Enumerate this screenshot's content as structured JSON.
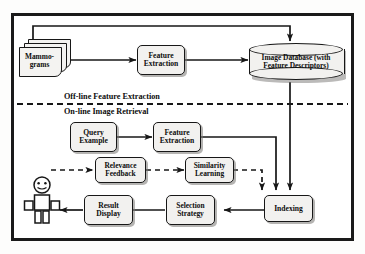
{
  "figure": {
    "border_color": "#1a1a1a",
    "node_fill": "#f2f1ef",
    "line_color": "#171717"
  },
  "phases": {
    "offline_label": "Off-line Feature Extraction",
    "online_label": "On-line Image Retrieval"
  },
  "nodes": {
    "mammograms": {
      "label": "Mammo-\ngrams",
      "shape": "stacked-documents"
    },
    "feature_extraction_offline": {
      "label": "Feature\nExtraction",
      "shape": "rounded-box"
    },
    "image_database": {
      "label": "Image Database (with\nFeature Descriptors)",
      "shape": "cylinder"
    },
    "query_example": {
      "label": "Query\nExample",
      "shape": "rounded-box"
    },
    "feature_extraction_online": {
      "label": "Feature\nExtraction",
      "shape": "rounded-box"
    },
    "relevance_feedback": {
      "label": "Relevance\nFeedback",
      "shape": "rounded-box"
    },
    "similarity_learning": {
      "label": "Similarity\nLearning",
      "shape": "rounded-box"
    },
    "indexing": {
      "label": "Indexing",
      "shape": "rounded-box"
    },
    "selection_strategy": {
      "label": "Selection\nStrategy",
      "shape": "rounded-box"
    },
    "result_display": {
      "label": "Result\nDisplay",
      "shape": "rounded-box"
    },
    "user": {
      "label": "",
      "shape": "stick-figure"
    }
  },
  "edges": [
    {
      "from": "mammograms",
      "to": "feature_extraction_offline",
      "style": "solid"
    },
    {
      "from": "mammograms",
      "to": "image_database",
      "style": "solid",
      "route": "up-over-down"
    },
    {
      "from": "feature_extraction_offline",
      "to": "image_database",
      "style": "solid"
    },
    {
      "from": "query_example",
      "to": "feature_extraction_online",
      "style": "solid"
    },
    {
      "from": "feature_extraction_online",
      "to": "indexing",
      "style": "solid",
      "route": "right-down"
    },
    {
      "from": "image_database",
      "to": "indexing",
      "style": "solid",
      "route": "down"
    },
    {
      "from": "indexing",
      "to": "selection_strategy",
      "style": "solid"
    },
    {
      "from": "selection_strategy",
      "to": "result_display",
      "style": "solid"
    },
    {
      "from": "result_display",
      "to": "user",
      "style": "solid"
    },
    {
      "from": "user",
      "to": "relevance_feedback",
      "style": "dashed"
    },
    {
      "from": "relevance_feedback",
      "to": "similarity_learning",
      "style": "dashed"
    },
    {
      "from": "similarity_learning",
      "to": "indexing",
      "style": "dashed",
      "route": "right-down"
    }
  ]
}
